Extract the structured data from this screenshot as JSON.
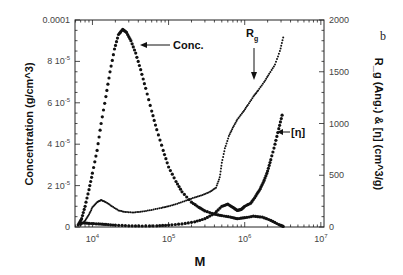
{
  "panel_label": "b",
  "chart_data": {
    "type": "scatter",
    "title": "",
    "xlabel": "M",
    "xscale": "log",
    "xlim": [
      5900,
      11000000
    ],
    "xticks": [
      10000,
      100000,
      1000000,
      10000000
    ],
    "xtick_labels": [
      "10^4",
      "10^5",
      "10^6",
      "10^7"
    ],
    "ylabel_left": "Concentration (g/cm^3)",
    "ylim_left": [
      0,
      0.0001
    ],
    "yticks_left": [
      "0",
      "2 10^-5",
      "4 10^-5",
      "6 10^-5",
      "8 10^-5",
      "0.0001"
    ],
    "ylabel_right": "R_g (Ang.) & [η] (cm^3/g)",
    "ylim_right": [
      0,
      2000
    ],
    "yticks_right": [
      "0",
      "500",
      "1000",
      "1500",
      "2000"
    ],
    "grid": false,
    "annotations": [
      {
        "text": "Conc.",
        "points_to": "concentration peak"
      },
      {
        "text": "R_g",
        "points_to": "Rg curve near M≈1.5e6"
      },
      {
        "text": "[η]",
        "points_to": "intrinsic viscosity curve near M≈2.5e6"
      }
    ],
    "series": [
      {
        "name": "Conc.",
        "axis": "left",
        "marker": "circle",
        "x": [
          6500,
          7200,
          8000,
          9000,
          10000,
          11500,
          13000,
          15000,
          17000,
          19500,
          22000,
          25000,
          28000,
          32000,
          37000,
          43000,
          50000,
          60000,
          70000,
          85000,
          100000,
          125000,
          150000,
          200000,
          250000,
          300000,
          400000,
          500000,
          650000,
          800000,
          1000000,
          1300000,
          1700000,
          2200000,
          2800000,
          3200000
        ],
        "y": [
          1e-06,
          4e-06,
          1e-05,
          1.8e-05,
          2.6e-05,
          3.7e-05,
          5e-05,
          6.3e-05,
          7.5e-05,
          8.6e-05,
          9.3e-05,
          9.55e-05,
          9.4e-05,
          9e-05,
          8.4e-05,
          7.6e-05,
          6.7e-05,
          5.6e-05,
          4.7e-05,
          3.7e-05,
          2.9e-05,
          2.2e-05,
          1.7e-05,
          1.2e-05,
          9.5e-06,
          7.8e-06,
          6.2e-06,
          5.5e-06,
          4.8e-06,
          4e-06,
          4.5e-06,
          5.2e-06,
          4.8e-06,
          3.2e-06,
          1.2e-06,
          3e-07
        ]
      },
      {
        "name": "R_g",
        "axis": "right",
        "marker": "small-dot",
        "x": [
          7000,
          8000,
          9000,
          10000,
          11500,
          13000,
          15000,
          18000,
          22000,
          27000,
          35000,
          45000,
          60000,
          80000,
          100000,
          130000,
          170000,
          220000,
          280000,
          350000,
          420000,
          470000,
          500000,
          550000,
          620000,
          700000,
          800000,
          950000,
          1100000,
          1300000,
          1500000,
          1800000,
          2100000,
          2500000,
          2900000,
          3200000
        ],
        "y": [
          20,
          60,
          120,
          190,
          240,
          260,
          240,
          200,
          160,
          145,
          140,
          150,
          165,
          185,
          200,
          225,
          255,
          285,
          310,
          340,
          380,
          480,
          620,
          760,
          880,
          960,
          1040,
          1110,
          1180,
          1260,
          1320,
          1400,
          1480,
          1570,
          1700,
          1830
        ]
      },
      {
        "name": "[η]",
        "axis": "right",
        "marker": "circle",
        "x": [
          7000,
          9000,
          12000,
          15000,
          20000,
          30000,
          45000,
          70000,
          100000,
          150000,
          220000,
          300000,
          400000,
          500000,
          600000,
          700000,
          800000,
          900000,
          1000000,
          1200000,
          1400000,
          1600000,
          1800000,
          2000000,
          2200000,
          2500000,
          2800000,
          3100000
        ],
        "y": [
          40,
          35,
          30,
          25,
          18,
          12,
          10,
          12,
          18,
          30,
          50,
          80,
          130,
          200,
          220,
          190,
          160,
          170,
          200,
          230,
          300,
          370,
          450,
          540,
          650,
          800,
          950,
          1080
        ]
      }
    ]
  }
}
